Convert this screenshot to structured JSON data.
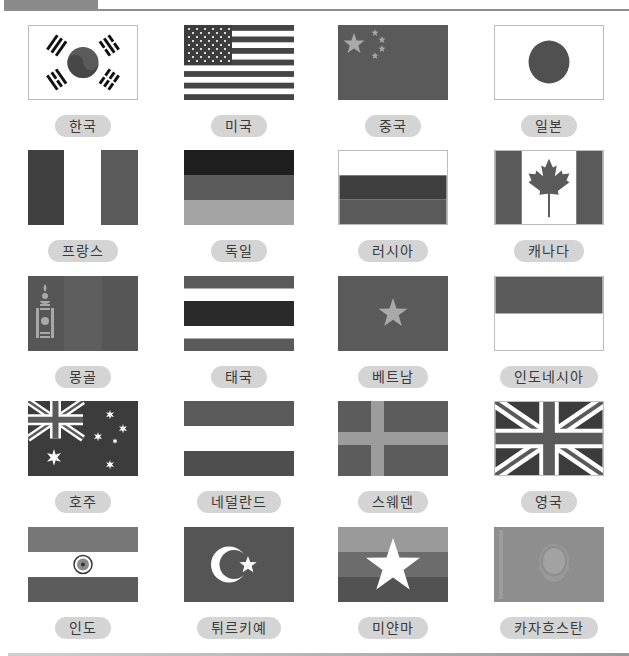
{
  "header": {
    "tab_label": ""
  },
  "colors": {
    "pill_bg": "#d4d4d4",
    "dark": "#3c3c3c",
    "mid": "#5e5e5e",
    "light": "#9a9a9a",
    "white": "#ffffff"
  },
  "flags": [
    {
      "id": "korea",
      "label": "한국"
    },
    {
      "id": "usa",
      "label": "미국"
    },
    {
      "id": "china",
      "label": "중국"
    },
    {
      "id": "japan",
      "label": "일본"
    },
    {
      "id": "france",
      "label": "프랑스"
    },
    {
      "id": "germany",
      "label": "독일"
    },
    {
      "id": "russia",
      "label": "러시아"
    },
    {
      "id": "canada",
      "label": "캐나다"
    },
    {
      "id": "mongolia",
      "label": "몽골"
    },
    {
      "id": "thailand",
      "label": "태국"
    },
    {
      "id": "vietnam",
      "label": "베트남"
    },
    {
      "id": "indonesia",
      "label": "인도네시아"
    },
    {
      "id": "australia",
      "label": "호주"
    },
    {
      "id": "netherlands",
      "label": "네덜란드"
    },
    {
      "id": "sweden",
      "label": "스웨덴"
    },
    {
      "id": "uk",
      "label": "영국"
    },
    {
      "id": "india",
      "label": "인도"
    },
    {
      "id": "turkiye",
      "label": "튀르키예"
    },
    {
      "id": "myanmar",
      "label": "미얀마"
    },
    {
      "id": "kazakhstan",
      "label": "카자흐스탄"
    }
  ]
}
